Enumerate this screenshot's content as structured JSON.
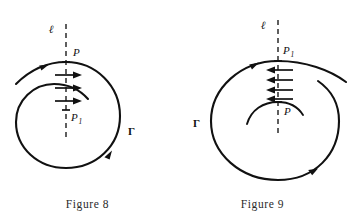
{
  "plate": {
    "name": "figures-8-and-9",
    "background_color": "#ffffff",
    "ink_color": "#111111"
  },
  "figures": [
    {
      "id": "figure-8",
      "caption": "Figure 8",
      "line_label": "ℓ",
      "upper_point_label": "P",
      "lower_point_label": "P",
      "lower_point_subscript": "1",
      "curve_label": "Γ",
      "flux_arrow_direction": "right",
      "flux_arrow_count": 3,
      "curve_orientation": "clockwise",
      "description": "Spiral curve crossing the dashed vertical line l at P above and at P1 below, with three horizontal arrows pointing right between the two crossings."
    },
    {
      "id": "figure-9",
      "caption": "Figure 9",
      "line_label": "ℓ",
      "upper_point_label": "P",
      "upper_point_subscript": "1",
      "lower_point_label": "P",
      "curve_label": "Γ",
      "flux_arrow_direction": "left",
      "flux_arrow_count": 4,
      "curve_orientation": "clockwise",
      "description": "Spiral curve crossing the dashed vertical line l at P1 above and at P below, with four horizontal arrows pointing left between the two crossings."
    }
  ]
}
